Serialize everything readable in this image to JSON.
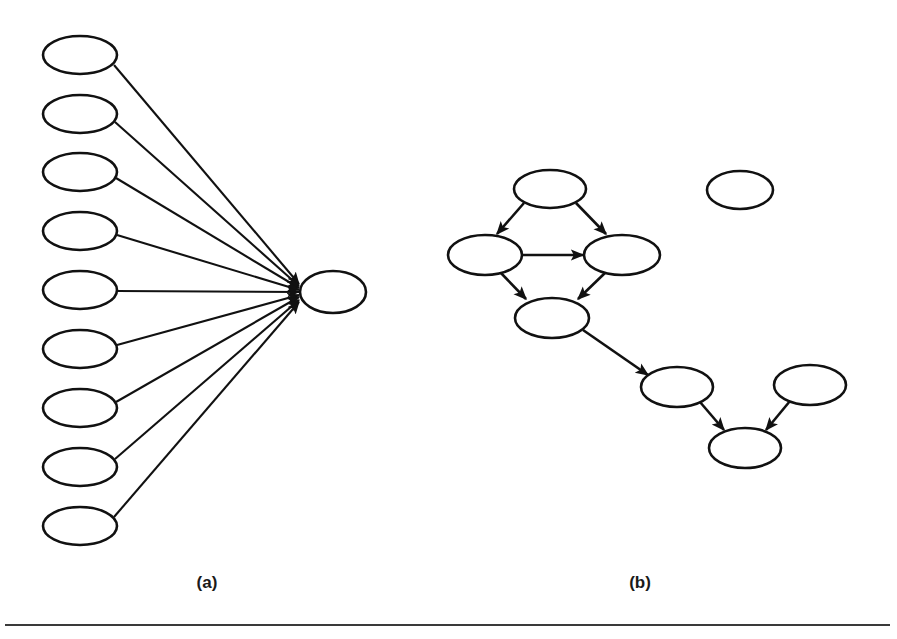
{
  "figure": {
    "background_color": "#ffffff",
    "stroke_color": "#111111",
    "panels": [
      {
        "id": "panel-a",
        "caption": "(a)",
        "caption_x": 207,
        "caption_y": 588,
        "description": "star-shaped graph: nine source nodes all pointing into one central sink node",
        "node_shape": "ellipse",
        "node_rx": 37,
        "node_ry": 19,
        "source_nodes": [
          {
            "id": "a1",
            "cx": 80,
            "cy": 55
          },
          {
            "id": "a2",
            "cx": 80,
            "cy": 114
          },
          {
            "id": "a3",
            "cx": 80,
            "cy": 172
          },
          {
            "id": "a4",
            "cx": 80,
            "cy": 231
          },
          {
            "id": "a5",
            "cx": 80,
            "cy": 290
          },
          {
            "id": "a6",
            "cx": 80,
            "cy": 349
          },
          {
            "id": "a7",
            "cx": 80,
            "cy": 408
          },
          {
            "id": "a8",
            "cx": 80,
            "cy": 467
          },
          {
            "id": "a9",
            "cx": 80,
            "cy": 526
          }
        ],
        "sink_node": {
          "id": "a-hub",
          "cx": 333,
          "cy": 292,
          "rx": 33,
          "ry": 21
        },
        "edges": [
          {
            "from": "a1",
            "to": "a-hub"
          },
          {
            "from": "a2",
            "to": "a-hub"
          },
          {
            "from": "a3",
            "to": "a-hub"
          },
          {
            "from": "a4",
            "to": "a-hub"
          },
          {
            "from": "a5",
            "to": "a-hub"
          },
          {
            "from": "a6",
            "to": "a-hub"
          },
          {
            "from": "a7",
            "to": "a-hub"
          },
          {
            "from": "a8",
            "to": "a-hub"
          },
          {
            "from": "a9",
            "to": "a-hub"
          }
        ],
        "edge_count": 9
      },
      {
        "id": "panel-b",
        "caption": "(b)",
        "caption_x": 640,
        "caption_y": 588,
        "description": "sparse directed graph: a diamond component, a chain component, and one isolated node",
        "node_shape": "ellipse",
        "nodes": [
          {
            "id": "b-top",
            "cx": 550,
            "cy": 189,
            "rx": 36,
            "ry": 19
          },
          {
            "id": "b-left",
            "cx": 485,
            "cy": 255,
            "rx": 37,
            "ry": 20
          },
          {
            "id": "b-right",
            "cx": 622,
            "cy": 255,
            "rx": 38,
            "ry": 20
          },
          {
            "id": "b-mid",
            "cx": 552,
            "cy": 318,
            "rx": 37,
            "ry": 20
          },
          {
            "id": "b-chain1",
            "cx": 677,
            "cy": 387,
            "rx": 36,
            "ry": 20
          },
          {
            "id": "b-chain2",
            "cx": 745,
            "cy": 448,
            "rx": 36,
            "ry": 20
          },
          {
            "id": "b-chainR",
            "cx": 810,
            "cy": 385,
            "rx": 36,
            "ry": 20
          },
          {
            "id": "b-isolated",
            "cx": 740,
            "cy": 190,
            "rx": 33,
            "ry": 19
          }
        ],
        "edges": [
          {
            "from": "b-top",
            "to": "b-left"
          },
          {
            "from": "b-top",
            "to": "b-right"
          },
          {
            "from": "b-left",
            "to": "b-right"
          },
          {
            "from": "b-left",
            "to": "b-mid"
          },
          {
            "from": "b-right",
            "to": "b-mid"
          },
          {
            "from": "b-mid",
            "to": "b-chain1"
          },
          {
            "from": "b-chain1",
            "to": "b-chain2"
          },
          {
            "from": "b-chainR",
            "to": "b-chain2"
          }
        ],
        "edge_count": 8,
        "isolated_node_count": 1
      }
    ],
    "footer_rule": {
      "x1": 5,
      "y1": 625,
      "x2": 890,
      "y2": 625
    }
  }
}
